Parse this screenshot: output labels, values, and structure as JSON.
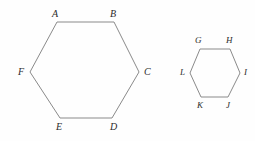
{
  "figure": {
    "background_color": "#fefefe",
    "stroke_color": "#8a8a8a",
    "label_color": "#2b2b2b",
    "shapes": [
      {
        "name": "large-hexagon",
        "points": "57,22 114,22 139,72 112,118 60,118 30,72",
        "labels": [
          {
            "text": "A",
            "x": 52,
            "y": 9
          },
          {
            "text": "B",
            "x": 110,
            "y": 9
          },
          {
            "text": "C",
            "x": 144,
            "y": 67
          },
          {
            "text": "D",
            "x": 110,
            "y": 122
          },
          {
            "text": "E",
            "x": 56,
            "y": 122
          },
          {
            "text": "F",
            "x": 18,
            "y": 67
          }
        ]
      },
      {
        "name": "small-hexagon",
        "points": "200,49 230,49 240,73 228,97 201,97 190,73",
        "labels": [
          {
            "text": "G",
            "x": 195,
            "y": 36
          },
          {
            "text": "H",
            "x": 226,
            "y": 36
          },
          {
            "text": "I",
            "x": 244,
            "y": 68
          },
          {
            "text": "J",
            "x": 226,
            "y": 101
          },
          {
            "text": "K",
            "x": 197,
            "y": 101
          },
          {
            "text": "L",
            "x": 180,
            "y": 68
          }
        ]
      }
    ]
  }
}
